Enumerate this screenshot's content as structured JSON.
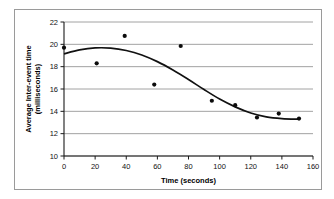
{
  "chart_data": {
    "type": "scatter",
    "title": "",
    "xlabel": "Time (seconds)",
    "ylabel": "Average Inter-event time (milliseconds)",
    "ylabel_line1": "Average Inter-event time",
    "ylabel_line2": "(milliseconds)",
    "xlim": [
      0,
      160
    ],
    "ylim": [
      10,
      22
    ],
    "xticks": [
      0,
      20,
      40,
      60,
      80,
      100,
      120,
      140,
      160
    ],
    "yticks": [
      10,
      12,
      14,
      16,
      18,
      20,
      22
    ],
    "xtick_labels": [
      "0",
      "20",
      "40",
      "60",
      "80",
      "100",
      "120",
      "140",
      "160"
    ],
    "ytick_labels": [
      "10",
      "12",
      "14",
      "16",
      "18",
      "20",
      "22"
    ],
    "grid": "horizontal",
    "legend": "none",
    "series": [
      {
        "name": "Average inter-event time",
        "marker": "filled-circle",
        "points": [
          {
            "x": 0,
            "y": 19.7
          },
          {
            "x": 21,
            "y": 18.3
          },
          {
            "x": 39,
            "y": 20.75
          },
          {
            "x": 58,
            "y": 16.4
          },
          {
            "x": 75,
            "y": 19.85
          },
          {
            "x": 95,
            "y": 14.95
          },
          {
            "x": 110,
            "y": 14.55
          },
          {
            "x": 124,
            "y": 13.45
          },
          {
            "x": 138,
            "y": 13.8
          },
          {
            "x": 151,
            "y": 13.35
          }
        ]
      },
      {
        "name": "Fitted trend curve",
        "marker": "none",
        "style": "smooth-line",
        "points": [
          {
            "x": 0,
            "y": 19.15
          },
          {
            "x": 10,
            "y": 19.5
          },
          {
            "x": 20,
            "y": 19.68
          },
          {
            "x": 30,
            "y": 19.66
          },
          {
            "x": 40,
            "y": 19.45
          },
          {
            "x": 50,
            "y": 19.05
          },
          {
            "x": 60,
            "y": 18.45
          },
          {
            "x": 70,
            "y": 17.7
          },
          {
            "x": 80,
            "y": 16.85
          },
          {
            "x": 90,
            "y": 15.95
          },
          {
            "x": 100,
            "y": 15.1
          },
          {
            "x": 110,
            "y": 14.4
          },
          {
            "x": 120,
            "y": 13.85
          },
          {
            "x": 130,
            "y": 13.5
          },
          {
            "x": 140,
            "y": 13.35
          },
          {
            "x": 151,
            "y": 13.3
          }
        ]
      }
    ]
  },
  "figure": {
    "background_color": "#ffffff",
    "frame_color": "#9a9a9a",
    "axis_color": "#1a1a1a",
    "grid_color": "#8a8a8a",
    "marker_color": "#0c0c0c",
    "curve_color": "#111111"
  }
}
